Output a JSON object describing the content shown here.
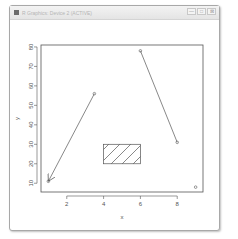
{
  "window": {
    "title": "R Graphics: Device 2 (ACTIVE)",
    "controls": [
      {
        "name": "minimize-button",
        "icon": "minimize-icon",
        "glyph": "—"
      },
      {
        "name": "maximize-button",
        "icon": "maximize-icon",
        "glyph": "□"
      },
      {
        "name": "close-button",
        "icon": "close-icon",
        "glyph": "⊠"
      }
    ]
  },
  "chart_data": {
    "type": "scatter",
    "title": "",
    "xlabel": "x",
    "ylabel": "y",
    "xlim": [
      0.6,
      9.4
    ],
    "ylim": [
      5.5,
      81
    ],
    "xticks": [
      2,
      4,
      6,
      8
    ],
    "yticks": [
      10,
      20,
      30,
      40,
      50,
      60,
      70,
      80
    ],
    "grid": false,
    "legend": null,
    "points": [
      {
        "x": 1,
        "y": 11
      },
      {
        "x": 3.5,
        "y": 56
      },
      {
        "x": 6,
        "y": 78
      },
      {
        "x": 8,
        "y": 31
      },
      {
        "x": 9,
        "y": 8
      }
    ],
    "annotations": [
      {
        "type": "arrow",
        "from": {
          "x": 3.5,
          "y": 56
        },
        "to": {
          "x": 1,
          "y": 11
        }
      },
      {
        "type": "segment",
        "from": {
          "x": 6,
          "y": 78
        },
        "to": {
          "x": 8,
          "y": 31
        }
      },
      {
        "type": "rect",
        "xmin": 4,
        "xmax": 6,
        "ymin": 20,
        "ymax": 30,
        "fill": "hatched"
      }
    ],
    "colors": {
      "line": "#555555",
      "axis": "#555555",
      "frame": "#555555"
    }
  }
}
